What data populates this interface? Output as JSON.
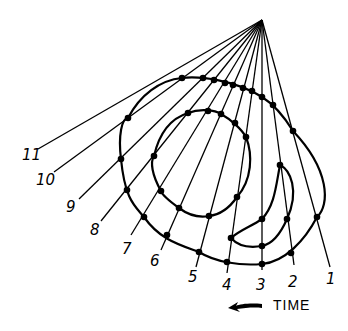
{
  "diagram": {
    "apex": {
      "x": 262,
      "y": 20
    },
    "rays": [
      {
        "label": "1",
        "end": {
          "x": 330,
          "y": 267
        },
        "label_pos": {
          "x": 326,
          "y": 284
        }
      },
      {
        "label": "2",
        "end": {
          "x": 294,
          "y": 265
        },
        "label_pos": {
          "x": 288,
          "y": 287
        }
      },
      {
        "label": "3",
        "end": {
          "x": 262,
          "y": 270
        },
        "label_pos": {
          "x": 256,
          "y": 290
        }
      },
      {
        "label": "4",
        "end": {
          "x": 227,
          "y": 273
        },
        "label_pos": {
          "x": 222,
          "y": 290
        }
      },
      {
        "label": "5",
        "end": {
          "x": 196,
          "y": 267
        },
        "label_pos": {
          "x": 188,
          "y": 282
        }
      },
      {
        "label": "6",
        "end": {
          "x": 161,
          "y": 250
        },
        "label_pos": {
          "x": 150,
          "y": 266
        }
      },
      {
        "label": "7",
        "end": {
          "x": 131,
          "y": 235
        },
        "label_pos": {
          "x": 122,
          "y": 254
        }
      },
      {
        "label": "8",
        "end": {
          "x": 101,
          "y": 221
        },
        "label_pos": {
          "x": 90,
          "y": 235
        }
      },
      {
        "label": "9",
        "end": {
          "x": 79,
          "y": 199
        },
        "label_pos": {
          "x": 66,
          "y": 212
        }
      },
      {
        "label": "10",
        "end": {
          "x": 54,
          "y": 172
        },
        "label_pos": {
          "x": 36,
          "y": 185
        }
      },
      {
        "label": "11",
        "end": {
          "x": 38,
          "y": 149
        },
        "label_pos": {
          "x": 22,
          "y": 160
        }
      }
    ],
    "dots": [
      [
        182,
        78
      ],
      [
        203,
        78
      ],
      [
        214,
        80
      ],
      [
        225,
        83
      ],
      [
        233,
        85
      ],
      [
        243,
        88
      ],
      [
        252,
        91
      ],
      [
        262,
        97
      ],
      [
        273,
        105
      ],
      [
        293,
        131
      ],
      [
        128,
        118
      ],
      [
        121,
        159
      ],
      [
        127,
        190
      ],
      [
        144,
        217
      ],
      [
        167,
        235
      ],
      [
        199,
        252
      ],
      [
        227,
        262
      ],
      [
        262,
        264
      ],
      [
        291,
        253
      ],
      [
        317,
        217
      ],
      [
        188,
        113
      ],
      [
        208,
        111
      ],
      [
        221,
        114
      ],
      [
        235,
        123
      ],
      [
        246,
        137
      ],
      [
        154,
        156
      ],
      [
        161,
        191
      ],
      [
        179,
        208
      ],
      [
        209,
        216
      ],
      [
        237,
        197
      ],
      [
        280,
        165
      ],
      [
        262,
        219
      ],
      [
        287,
        219
      ],
      [
        231,
        238
      ],
      [
        262,
        246
      ]
    ],
    "time_label": "TIME",
    "arrow_direction": "left"
  }
}
